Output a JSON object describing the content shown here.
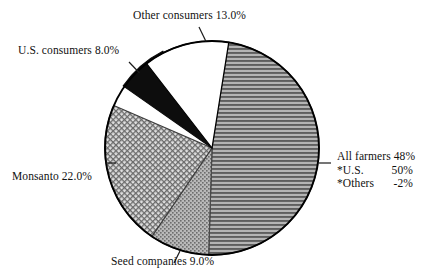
{
  "page": {
    "background_color": "#ffffff",
    "text_color": "#111111"
  },
  "chart_data": {
    "type": "pie",
    "title": "",
    "subtitle": "",
    "xlabel": "",
    "ylabel": "",
    "legend_position": "callout-labels",
    "grid": false,
    "units": "percent",
    "total": 100,
    "start_angle_deg": 9,
    "direction": "clockwise",
    "categories": [
      "All farmers",
      "Seed companies",
      "Monsanto",
      "U.S. consumers",
      "Other consumers"
    ],
    "values": [
      48,
      9,
      22,
      8,
      13
    ],
    "slices": [
      {
        "name": "All farmers",
        "label": "All farmers 48%",
        "value": 48,
        "value_text": "48%",
        "fill_style": "horizontal-lines",
        "fill_color": "#8f8f8f",
        "line_color": "#3a3a3a",
        "notes": [
          {
            "name": "*U.S.",
            "value_text": "50%"
          },
          {
            "name": "*Others",
            "value_text": "-2%"
          }
        ]
      },
      {
        "name": "Seed companies",
        "label": "Seed companies 9.0%",
        "value": 9,
        "value_text": "9.0%",
        "fill_style": "stipple-dots",
        "fill_color": "#a8a8a8",
        "line_color": "#6e6e6e"
      },
      {
        "name": "Monsanto",
        "label": "Monsanto 22.0%",
        "value": 22,
        "value_text": "22.0%",
        "fill_style": "diagonal-crosshatch",
        "fill_color": "#c9c9c9",
        "line_color": "#555555"
      },
      {
        "name": "U.S. consumers",
        "label": "U.S. consumers 8.0%",
        "value": 8,
        "value_text": "8.0%",
        "fill_style": "solid",
        "fill_color": "#0d0d0d",
        "line_color": "#0d0d0d"
      },
      {
        "name": "Other consumers",
        "label": "Other consumers 13.0%",
        "value": 13,
        "value_text": "13.0%",
        "fill_style": "solid",
        "fill_color": "#ffffff",
        "line_color": "#000000"
      }
    ]
  },
  "labels": {
    "other_consumers": "Other consumers 13.0%",
    "us_consumers": "U.S. consumers 8.0%",
    "monsanto": "Monsanto 22.0%",
    "seed_companies": "Seed companies 9.0%",
    "all_farmers": "All farmers 48%",
    "note_us_name": "*U.S.",
    "note_us_value": "50%",
    "note_others_name": "*Others",
    "note_others_value": "-2%"
  },
  "geometry": {
    "center_x": 212,
    "center_y": 148,
    "radius": 107,
    "outline_color": "#000000",
    "outline_width": 1.8
  }
}
